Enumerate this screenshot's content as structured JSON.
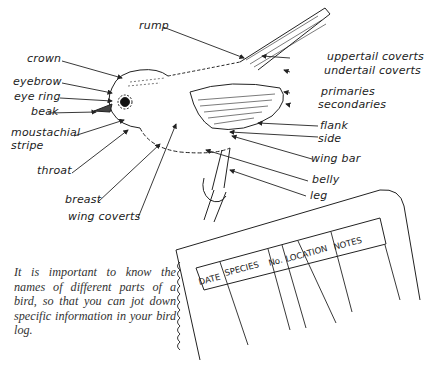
{
  "diagram": {
    "title": "Parts of a bird",
    "labels": {
      "rump": "rump",
      "crown": "crown",
      "eyebrow": "eyebrow",
      "eye_ring": "eye ring",
      "beak": "beak",
      "moustachial_1": "moustachial",
      "moustachial_2": "stripe",
      "throat": "throat",
      "breast": "breast",
      "wing_coverts": "wing coverts",
      "uppertail_coverts": "uppertail coverts",
      "undertail_coverts": "undertail coverts",
      "primaries": "primaries",
      "secondaries": "secondaries",
      "flank": "flank",
      "side": "side",
      "wing_bar": "wing bar",
      "belly": "belly",
      "leg": "leg"
    }
  },
  "notebook": {
    "columns": [
      "DATE",
      "SPECIES",
      "No.",
      "LOCATION",
      "NOTES"
    ]
  },
  "caption": "It is important to know the names of different parts of a bird, so that you can jot down specific information in your bird log."
}
